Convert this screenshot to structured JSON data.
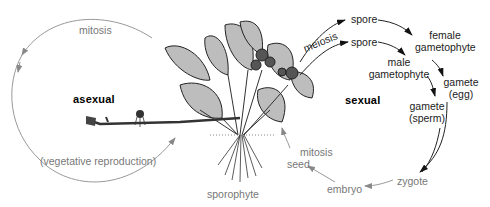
{
  "diagram": {
    "colors": {
      "asexual_arrow": "#8a8a8a",
      "sexual_arrow": "#1a1a1a",
      "later_arrow": "#8a8a8a",
      "plant_ink": "#2a2a2a"
    },
    "asexual": {
      "heading": "asexual",
      "process": "mitosis",
      "note": "(vegetative reproduction)"
    },
    "center": {
      "plant_label": "sporophyte"
    },
    "sexual": {
      "heading": "sexual",
      "meiosis": "meiosis",
      "spore_top": "spore",
      "spore_bottom": "spore",
      "female_gametophyte": [
        "female",
        "gametophyte"
      ],
      "male_gametophyte": [
        "male",
        "gametophyte"
      ],
      "gamete_egg": [
        "gamete",
        "(egg)"
      ],
      "gamete_sperm": [
        "gamete",
        "(sperm)"
      ],
      "zygote": "zygote",
      "embryo": "embryo",
      "seed": "seed",
      "mitosis": "mitosis"
    }
  }
}
